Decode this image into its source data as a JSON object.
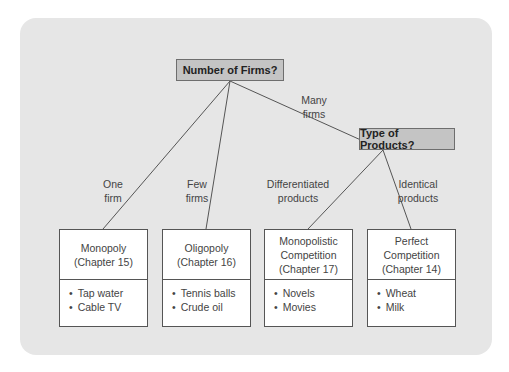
{
  "diagram": {
    "root_question": "Number of Firms?",
    "sub_question": "Type of Products?",
    "edges": {
      "one": [
        "One",
        "firm"
      ],
      "few": [
        "Few",
        "firms"
      ],
      "many": [
        "Many",
        "firms"
      ],
      "differentiated": [
        "Differentiated",
        "products"
      ],
      "identical": [
        "Identical",
        "products"
      ]
    },
    "markets": [
      {
        "title": [
          "Monopoly"
        ],
        "chapter": "(Chapter 15)",
        "examples": [
          "Tap water",
          "Cable TV"
        ]
      },
      {
        "title": [
          "Oligopoly"
        ],
        "chapter": "(Chapter 16)",
        "examples": [
          "Tennis balls",
          "Crude oil"
        ]
      },
      {
        "title": [
          "Monopolistic",
          "Competition"
        ],
        "chapter": "(Chapter 17)",
        "examples": [
          "Novels",
          "Movies"
        ]
      },
      {
        "title": [
          "Perfect",
          "Competition"
        ],
        "chapter": "(Chapter 14)",
        "examples": [
          "Wheat",
          "Milk"
        ]
      }
    ]
  },
  "colors": {
    "panel": "#e6e6e6",
    "question_box": "#c4c4c4",
    "market_box": "#ffffff",
    "lines": "#555555"
  }
}
